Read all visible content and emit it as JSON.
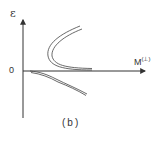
{
  "figure": {
    "caption": "(b)",
    "axes": {
      "y_label": "ε",
      "x_label_base": "M",
      "x_label_sup": "(⊥)",
      "origin_label": "0"
    },
    "colors": {
      "line": "#333333",
      "background": "#ffffff"
    },
    "curves": [
      {
        "name": "upper-branch-curve",
        "description": "double-line parabola opening right, from upper right through vertex near ε-axis side down to M axis"
      },
      {
        "name": "lower-branch-curve",
        "description": "double-line curve starting at origin bending downward to the right"
      }
    ]
  }
}
